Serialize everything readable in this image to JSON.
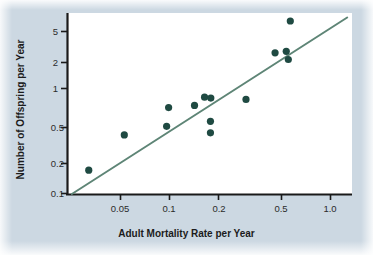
{
  "figure": {
    "background_color": "#ccd8e2",
    "plot_background_color": "#ffffff",
    "marker_color": "#1f4a42",
    "line_color": "#5e8576",
    "axis_color": "#1a1a1a"
  },
  "chart_data": {
    "type": "scatter",
    "title": "",
    "xlabel": "Adult Mortality Rate per Year",
    "ylabel": "Number of Offspring per Year",
    "xscale": "log",
    "yscale": "log",
    "xlim": [
      0.03,
      1.3
    ],
    "ylim": [
      0.1,
      7.0
    ],
    "grid": false,
    "legend": null,
    "xticks": [
      0.05,
      0.1,
      0.2,
      0.5,
      1.0
    ],
    "xtick_labels": [
      "0.05",
      "0.1",
      "0.2",
      "0.5",
      "1.0"
    ],
    "yticks": [
      0.1,
      0.2,
      0.5,
      1,
      2,
      5
    ],
    "ytick_labels": [
      "0.1",
      "0.2",
      "0.5",
      "1",
      "2",
      "5"
    ],
    "x": [
      0.04,
      0.064,
      0.112,
      0.115,
      0.162,
      0.185,
      0.196,
      0.201,
      0.2,
      0.2,
      0.32,
      0.47,
      0.545,
      0.56,
      0.575
    ],
    "y": [
      0.175,
      0.4,
      0.49,
      0.76,
      0.8,
      0.97,
      0.95,
      0.55,
      0.42,
      0.95,
      0.92,
      2.75,
      2.85,
      2.35,
      5.8
    ],
    "points": [
      {
        "x": 0.04,
        "y": 0.175
      },
      {
        "x": 0.064,
        "y": 0.4
      },
      {
        "x": 0.112,
        "y": 0.49
      },
      {
        "x": 0.115,
        "y": 0.76
      },
      {
        "x": 0.162,
        "y": 0.8
      },
      {
        "x": 0.185,
        "y": 0.97
      },
      {
        "x": 0.201,
        "y": 0.95
      },
      {
        "x": 0.2,
        "y": 0.55
      },
      {
        "x": 0.2,
        "y": 0.42
      },
      {
        "x": 0.32,
        "y": 0.92
      },
      {
        "x": 0.47,
        "y": 2.75
      },
      {
        "x": 0.545,
        "y": 2.85
      },
      {
        "x": 0.56,
        "y": 2.35
      },
      {
        "x": 0.575,
        "y": 5.8
      }
    ],
    "fit_line": {
      "type": "linear-on-log-log",
      "x_start": 0.032,
      "y_start": 0.1,
      "x_end": 1.22,
      "y_end": 6.3
    },
    "annotations": []
  }
}
